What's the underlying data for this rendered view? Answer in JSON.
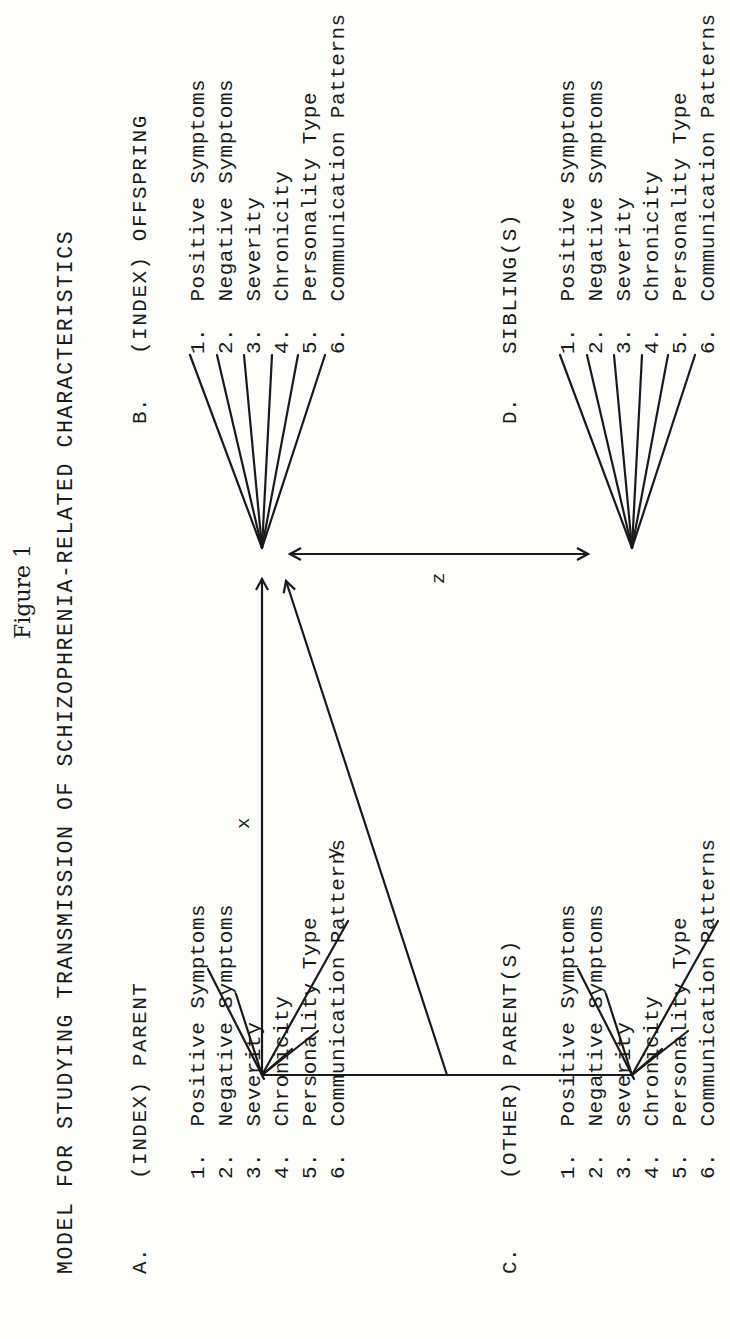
{
  "figure_label": "Figure 1",
  "title": "MODEL FOR STUDYING TRANSMISSION OF SCHIZOPHRENIA-RELATED CHARACTERISTICS",
  "nodes": [
    {
      "id": "A",
      "letter": "A.",
      "heading": "(INDEX) PARENT",
      "items": [
        {
          "num": "1.",
          "label": "Positive Symptoms"
        },
        {
          "num": "2.",
          "label": "Negative Symptoms"
        },
        {
          "num": "3.",
          "label": "Severity"
        },
        {
          "num": "4.",
          "label": "Chronicity"
        },
        {
          "num": "5.",
          "label": "Personality Type"
        },
        {
          "num": "6.",
          "label": "Communication Patterns"
        }
      ]
    },
    {
      "id": "B",
      "letter": "B.",
      "heading": "(INDEX) OFFSPRING",
      "items": [
        {
          "num": "1.",
          "label": "Positive Symptoms"
        },
        {
          "num": "2.",
          "label": "Negative Symptoms"
        },
        {
          "num": "3.",
          "label": "Severity"
        },
        {
          "num": "4.",
          "label": "Chronicity"
        },
        {
          "num": "5.",
          "label": "Personality Type"
        },
        {
          "num": "6.",
          "label": "Communication Patterns"
        }
      ]
    },
    {
      "id": "C",
      "letter": "C.",
      "heading": "(OTHER) PARENT(S)",
      "items": [
        {
          "num": "1.",
          "label": "Positive Symptoms"
        },
        {
          "num": "2.",
          "label": "Negative Symptoms"
        },
        {
          "num": "3.",
          "label": "Severity"
        },
        {
          "num": "4.",
          "label": "Chronicity"
        },
        {
          "num": "5.",
          "label": "Personality Type"
        },
        {
          "num": "6.",
          "label": "Communication Patterns"
        }
      ]
    },
    {
      "id": "D",
      "letter": "D.",
      "heading": "SIBLING(S)",
      "items": [
        {
          "num": "1.",
          "label": "Positive Symptoms"
        },
        {
          "num": "2.",
          "label": "Negative Symptoms"
        },
        {
          "num": "3.",
          "label": "Severity"
        },
        {
          "num": "4.",
          "label": "Chronicity"
        },
        {
          "num": "5.",
          "label": "Personality Type"
        },
        {
          "num": "6.",
          "label": "Communication Patterns"
        }
      ]
    }
  ],
  "edges": [
    {
      "label": "x",
      "from": "A",
      "to": "B",
      "type": "directed"
    },
    {
      "label": "y",
      "from": "A-C link",
      "to": "B",
      "type": "directed"
    },
    {
      "label": "z",
      "from": "B",
      "to": "D",
      "type": "bidirectional"
    }
  ],
  "colors": {
    "ink": "#1a1a1a",
    "paper": "#fdfdfc"
  }
}
